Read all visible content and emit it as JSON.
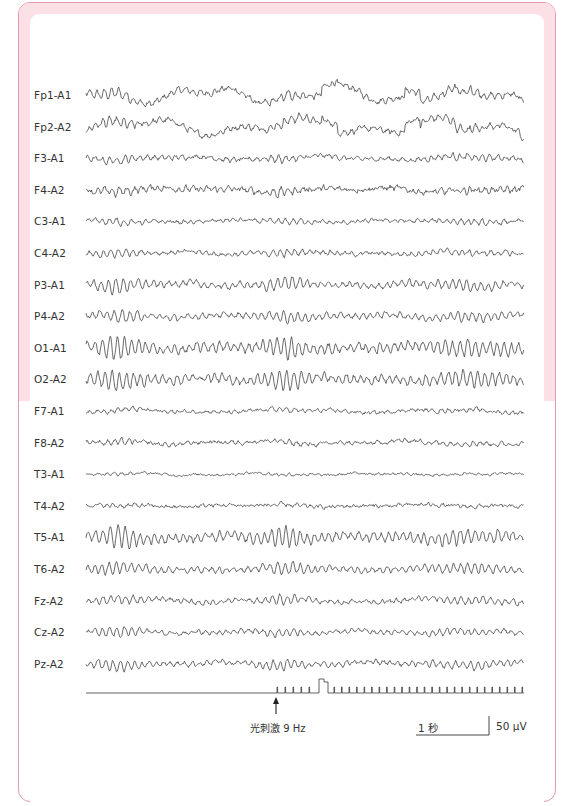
{
  "chart_data": {
    "type": "line",
    "title": "",
    "channels": [
      {
        "label": "Fp1-A1",
        "amp": 1.0,
        "alpha": 0.35,
        "slow": 0.9,
        "fast": 0.25
      },
      {
        "label": "Fp2-A2",
        "amp": 1.0,
        "alpha": 0.35,
        "slow": 0.9,
        "fast": 0.25
      },
      {
        "label": "F3-A1",
        "amp": 0.55,
        "alpha": 0.5,
        "slow": 0.4,
        "fast": 0.35
      },
      {
        "label": "F4-A2",
        "amp": 0.6,
        "alpha": 0.5,
        "slow": 0.4,
        "fast": 0.45
      },
      {
        "label": "C3-A1",
        "amp": 0.45,
        "alpha": 0.55,
        "slow": 0.3,
        "fast": 0.35
      },
      {
        "label": "C4-A2",
        "amp": 0.5,
        "alpha": 0.55,
        "slow": 0.3,
        "fast": 0.35
      },
      {
        "label": "P3-A1",
        "amp": 0.65,
        "alpha": 0.8,
        "slow": 0.3,
        "fast": 0.3
      },
      {
        "label": "P4-A2",
        "amp": 0.6,
        "alpha": 0.75,
        "slow": 0.3,
        "fast": 0.3
      },
      {
        "label": "O1-A1",
        "amp": 0.85,
        "alpha": 1.0,
        "slow": 0.25,
        "fast": 0.3
      },
      {
        "label": "O2-A2",
        "amp": 0.8,
        "alpha": 1.0,
        "slow": 0.25,
        "fast": 0.3
      },
      {
        "label": "F7-A1",
        "amp": 0.4,
        "alpha": 0.35,
        "slow": 0.45,
        "fast": 0.4
      },
      {
        "label": "F8-A2",
        "amp": 0.45,
        "alpha": 0.4,
        "slow": 0.45,
        "fast": 0.4
      },
      {
        "label": "T3-A1",
        "amp": 0.25,
        "alpha": 0.35,
        "slow": 0.5,
        "fast": 0.45
      },
      {
        "label": "T4-A2",
        "amp": 0.3,
        "alpha": 0.35,
        "slow": 0.4,
        "fast": 0.6
      },
      {
        "label": "T5-A1",
        "amp": 0.8,
        "alpha": 1.0,
        "slow": 0.25,
        "fast": 0.3
      },
      {
        "label": "T6-A2",
        "amp": 0.6,
        "alpha": 0.85,
        "slow": 0.25,
        "fast": 0.3
      },
      {
        "label": "Fz-A2",
        "amp": 0.6,
        "alpha": 0.6,
        "slow": 0.35,
        "fast": 0.3
      },
      {
        "label": "Cz-A2",
        "amp": 0.55,
        "alpha": 0.6,
        "slow": 0.35,
        "fast": 0.3
      },
      {
        "label": "Pz-A2",
        "amp": 0.6,
        "alpha": 0.7,
        "slow": 0.3,
        "fast": 0.3
      }
    ],
    "layout": {
      "first_row_y": 95,
      "row_spacing": 31.6,
      "trace_x_start": 86,
      "trace_x_end": 524,
      "max_amplitude_px": 14
    },
    "stimulus": {
      "label": "光刺激 9 Hz",
      "frequency_hz": 9,
      "baseline_y": 693,
      "onset_x": 277,
      "pre_pulses_x": [
        277,
        285,
        293,
        301,
        309
      ],
      "tall_pulse": {
        "x_start": 319,
        "x_step": 324,
        "x_end": 328,
        "top_y": 679,
        "step_y": 682
      },
      "post_pulse_start_x": 334,
      "post_pulse_end_x": 522,
      "post_pulse_count": 26,
      "tick_height": 6,
      "line_start_x": 86,
      "line_end_x": 524
    },
    "scale_bar": {
      "time_label": "1 秒",
      "amplitude_label": "50 μV",
      "time_length_px": 73,
      "amplitude_length_px": 19
    },
    "xlabel": "",
    "ylabel": ""
  },
  "colors": {
    "frame_border": "#e79aab",
    "frame_band": "#fbe1e6",
    "trace": "#3a3a3a",
    "text": "#333333"
  }
}
